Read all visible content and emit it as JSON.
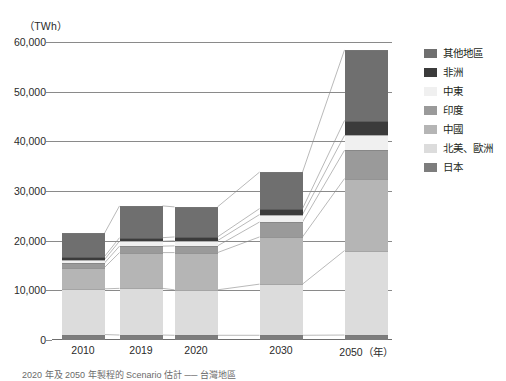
{
  "unit_label": "（TWh）",
  "axis": {
    "y_ticks": [
      "60,000",
      "50,000",
      "40,000",
      "30,000",
      "20,000",
      "10,000",
      "0"
    ],
    "y_min": 0,
    "y_max": 60000,
    "y_step": 10000,
    "x_labels": [
      "2010",
      "2019",
      "2020",
      "2030",
      "2050"
    ],
    "x_unit": "（年）"
  },
  "legend": {
    "items": [
      {
        "label": "其他地區",
        "color": "#6f6f6f"
      },
      {
        "label": "非洲",
        "color": "#3b3b3b"
      },
      {
        "label": "中東",
        "color": "#f0f0f0"
      },
      {
        "label": "印度",
        "color": "#9a9a9a"
      },
      {
        "label": "中國",
        "color": "#b5b5b5"
      },
      {
        "label": "北美、歐洲",
        "color": "#dcdcdc"
      },
      {
        "label": "日本",
        "color": "#7d7d7d"
      }
    ]
  },
  "caption": "2020 年及 2050 年製程的 Scenario 估計 ── 台灣地區",
  "chart_data": {
    "type": "bar",
    "stacked": true,
    "title": "",
    "xlabel": "年",
    "ylabel": "TWh",
    "ylim": [
      0,
      60000
    ],
    "ystep": 10000,
    "grid": true,
    "legend_position": "right",
    "categories": [
      "2010",
      "2019",
      "2020",
      "2030",
      "2050"
    ],
    "series": [
      {
        "name": "日本",
        "color": "#7d7d7d",
        "values": [
          1100,
          1000,
          950,
          950,
          1000
        ]
      },
      {
        "name": "北美、歐洲",
        "color": "#dcdcdc",
        "values": [
          9200,
          9400,
          9150,
          10300,
          17000
        ]
      },
      {
        "name": "中國",
        "color": "#b5b5b5",
        "values": [
          4300,
          7200,
          7500,
          9500,
          14500
        ]
      },
      {
        "name": "印度",
        "color": "#9a9a9a",
        "values": [
          900,
          1300,
          1350,
          3000,
          5700
        ]
      },
      {
        "name": "中東",
        "color": "#f0f0f0",
        "values": [
          700,
          1000,
          1050,
          1500,
          3000
        ]
      },
      {
        "name": "非洲",
        "color": "#3b3b3b",
        "values": [
          600,
          700,
          750,
          1200,
          3000
        ]
      },
      {
        "name": "其他地區",
        "color": "#6f6f6f",
        "values": [
          4700,
          6400,
          6050,
          7350,
          14200
        ]
      }
    ],
    "totals": [
      21500,
      27000,
      26800,
      33800,
      58400
    ]
  }
}
